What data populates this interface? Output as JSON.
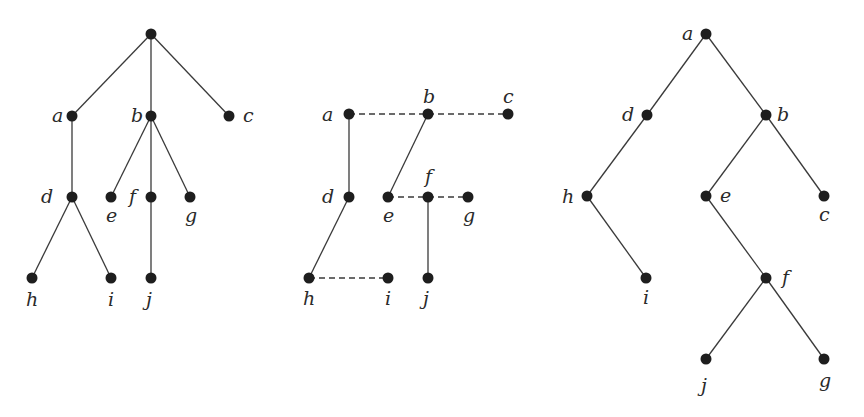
{
  "diagrams": [
    {
      "name": "ordered-tree",
      "nodes": [
        {
          "id": "root",
          "label": "",
          "x": 151,
          "y": 34
        },
        {
          "id": "a",
          "label": "a",
          "x": 72,
          "y": 116,
          "lx": 52,
          "ly": 122
        },
        {
          "id": "b",
          "label": "b",
          "x": 151,
          "y": 116,
          "lx": 131,
          "ly": 122
        },
        {
          "id": "c",
          "label": "c",
          "x": 229,
          "y": 116,
          "lx": 243,
          "ly": 122
        },
        {
          "id": "d",
          "label": "d",
          "x": 72,
          "y": 197,
          "lx": 41,
          "ly": 203
        },
        {
          "id": "e",
          "label": "e",
          "x": 111,
          "y": 197,
          "lx": 106,
          "ly": 222
        },
        {
          "id": "f",
          "label": "f",
          "x": 151,
          "y": 197,
          "lx": 129,
          "ly": 203
        },
        {
          "id": "g",
          "label": "g",
          "x": 190,
          "y": 197,
          "lx": 185,
          "ly": 222
        },
        {
          "id": "h",
          "label": "h",
          "x": 32,
          "y": 278,
          "lx": 26,
          "ly": 306
        },
        {
          "id": "i",
          "label": "i",
          "x": 111,
          "y": 278,
          "lx": 108,
          "ly": 306
        },
        {
          "id": "j",
          "label": "j",
          "x": 151,
          "y": 278,
          "lx": 146,
          "ly": 306
        }
      ],
      "edges": [
        {
          "from": "root",
          "to": "a",
          "style": "solid"
        },
        {
          "from": "root",
          "to": "b",
          "style": "solid"
        },
        {
          "from": "root",
          "to": "c",
          "style": "solid"
        },
        {
          "from": "a",
          "to": "d",
          "style": "solid"
        },
        {
          "from": "b",
          "to": "e",
          "style": "solid"
        },
        {
          "from": "b",
          "to": "f",
          "style": "solid"
        },
        {
          "from": "b",
          "to": "g",
          "style": "solid"
        },
        {
          "from": "d",
          "to": "h",
          "style": "solid"
        },
        {
          "from": "d",
          "to": "i",
          "style": "solid"
        },
        {
          "from": "f",
          "to": "j",
          "style": "solid"
        }
      ]
    },
    {
      "name": "first-child-next-sibling",
      "nodes": [
        {
          "id": "a",
          "label": "a",
          "x": 349,
          "y": 114,
          "lx": 322,
          "ly": 121
        },
        {
          "id": "b",
          "label": "b",
          "x": 428,
          "y": 114,
          "lx": 423,
          "ly": 103
        },
        {
          "id": "c",
          "label": "c",
          "x": 508,
          "y": 114,
          "lx": 503,
          "ly": 103
        },
        {
          "id": "d",
          "label": "d",
          "x": 349,
          "y": 197,
          "lx": 322,
          "ly": 203
        },
        {
          "id": "e",
          "label": "e",
          "x": 388,
          "y": 197,
          "lx": 383,
          "ly": 222
        },
        {
          "id": "f",
          "label": "f",
          "x": 428,
          "y": 197,
          "lx": 425,
          "ly": 183
        },
        {
          "id": "g",
          "label": "g",
          "x": 468,
          "y": 197,
          "lx": 463,
          "ly": 222
        },
        {
          "id": "h",
          "label": "h",
          "x": 309,
          "y": 278,
          "lx": 303,
          "ly": 305
        },
        {
          "id": "i",
          "label": "i",
          "x": 388,
          "y": 278,
          "lx": 385,
          "ly": 305
        },
        {
          "id": "j",
          "label": "j",
          "x": 428,
          "y": 278,
          "lx": 423,
          "ly": 305
        }
      ],
      "edges": [
        {
          "from": "a",
          "to": "b",
          "style": "dashed"
        },
        {
          "from": "b",
          "to": "c",
          "style": "dashed"
        },
        {
          "from": "a",
          "to": "d",
          "style": "solid"
        },
        {
          "from": "b",
          "to": "e",
          "style": "solid"
        },
        {
          "from": "e",
          "to": "f",
          "style": "dashed"
        },
        {
          "from": "f",
          "to": "g",
          "style": "dashed"
        },
        {
          "from": "d",
          "to": "h",
          "style": "solid"
        },
        {
          "from": "h",
          "to": "i",
          "style": "dashed"
        },
        {
          "from": "f",
          "to": "j",
          "style": "solid"
        }
      ]
    },
    {
      "name": "binary-tree",
      "nodes": [
        {
          "id": "a",
          "label": "a",
          "x": 706,
          "y": 34,
          "lx": 682,
          "ly": 40
        },
        {
          "id": "d",
          "label": "d",
          "x": 647,
          "y": 115,
          "lx": 622,
          "ly": 121
        },
        {
          "id": "b",
          "label": "b",
          "x": 766,
          "y": 115,
          "lx": 777,
          "ly": 121
        },
        {
          "id": "h",
          "label": "h",
          "x": 587,
          "y": 196,
          "lx": 562,
          "ly": 203
        },
        {
          "id": "e",
          "label": "e",
          "x": 706,
          "y": 196,
          "lx": 720,
          "ly": 202
        },
        {
          "id": "c",
          "label": "c",
          "x": 824,
          "y": 196,
          "lx": 819,
          "ly": 221
        },
        {
          "id": "i",
          "label": "i",
          "x": 646,
          "y": 278,
          "lx": 643,
          "ly": 304
        },
        {
          "id": "f",
          "label": "f",
          "x": 766,
          "y": 278,
          "lx": 782,
          "ly": 284
        },
        {
          "id": "j",
          "label": "j",
          "x": 706,
          "y": 359,
          "lx": 701,
          "ly": 392
        },
        {
          "id": "g",
          "label": "g",
          "x": 824,
          "y": 359,
          "lx": 819,
          "ly": 387
        }
      ],
      "edges": [
        {
          "from": "a",
          "to": "d",
          "style": "solid"
        },
        {
          "from": "a",
          "to": "b",
          "style": "solid"
        },
        {
          "from": "d",
          "to": "h",
          "style": "solid"
        },
        {
          "from": "b",
          "to": "e",
          "style": "solid"
        },
        {
          "from": "b",
          "to": "c",
          "style": "solid"
        },
        {
          "from": "h",
          "to": "i",
          "style": "solid"
        },
        {
          "from": "e",
          "to": "f",
          "style": "solid"
        },
        {
          "from": "f",
          "to": "j",
          "style": "solid"
        },
        {
          "from": "f",
          "to": "g",
          "style": "solid"
        }
      ]
    }
  ]
}
